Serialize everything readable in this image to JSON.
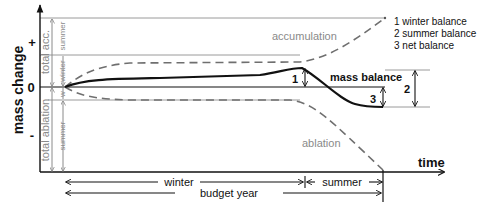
{
  "axes": {
    "y_label": "mass change",
    "y_plus": "+",
    "y_zero": "0",
    "y_minus": "-",
    "x_label": "time"
  },
  "left_brackets": {
    "total_acc": "total acc.",
    "total_ablation": "total ablation",
    "acc_summer": "summer",
    "acc_winter": "winter",
    "abl_w": "w",
    "abl_summer": "summer"
  },
  "curves": {
    "accumulation": "accumulation",
    "ablation": "ablation",
    "mass_balance": "mass balance"
  },
  "markers": {
    "m1": "1",
    "m2": "2",
    "m3": "3"
  },
  "legend": [
    {
      "label": "1 winter balance"
    },
    {
      "label": "2 summer balance"
    },
    {
      "label": "3 net balance"
    }
  ],
  "periods": {
    "winter": "winter",
    "summer": "summer",
    "budget_year": "budget year"
  },
  "colors": {
    "axis": "#111111",
    "gray_text": "#8a8a8a",
    "gray_line": "#9a9a9a",
    "dashed": "#6f6f6f"
  }
}
